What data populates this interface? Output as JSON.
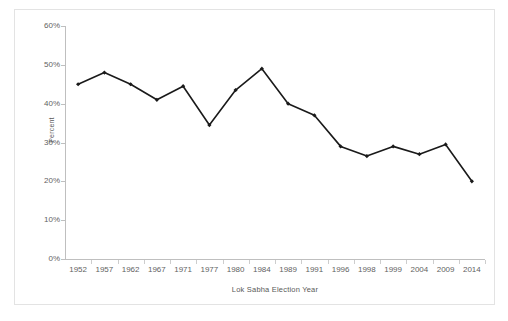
{
  "chart_data": {
    "type": "line",
    "title": "",
    "xlabel": "Lok Sabha Election Year",
    "ylabel": "Percent",
    "categories": [
      "1952",
      "1957",
      "1962",
      "1967",
      "1971",
      "1977",
      "1980",
      "1984",
      "1989",
      "1991",
      "1996",
      "1998",
      "1999",
      "2004",
      "2009",
      "2014"
    ],
    "values": [
      45,
      48,
      45,
      41,
      44.5,
      34.5,
      43.5,
      49,
      40,
      37,
      29,
      26.5,
      29,
      27,
      29.5,
      20
    ],
    "series": [
      {
        "name": "Percent",
        "values": [
          45,
          48,
          45,
          41,
          44.5,
          34.5,
          43.5,
          49,
          40,
          37,
          29,
          26.5,
          29,
          27,
          29.5,
          20
        ]
      }
    ],
    "ylim": [
      0,
      60
    ],
    "ytick_labels": [
      "0%",
      "10%",
      "20%",
      "30%",
      "40%",
      "50%",
      "60%"
    ],
    "ytick_values": [
      0,
      10,
      20,
      30,
      40,
      50,
      60
    ],
    "grid": false,
    "legend": "none",
    "marker": "filled-diamond",
    "line_color": "#1a1a1a",
    "axis_color": "#bfbfbf",
    "text_color": "#5f5f5f",
    "border_color": "#e3e3e3",
    "background": "#ffffff"
  },
  "axis": {
    "y_title": "Percent",
    "x_title": "Lok Sabha Election Year"
  }
}
